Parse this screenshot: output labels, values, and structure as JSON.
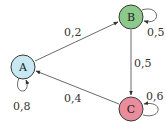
{
  "diagram": {
    "type": "markov-chain",
    "nodes": [
      {
        "id": "A",
        "label": "A",
        "color": "#c8e8f4"
      },
      {
        "id": "B",
        "label": "B",
        "color": "#8cc98a"
      },
      {
        "id": "C",
        "label": "C",
        "color": "#e98c9c"
      }
    ],
    "edges": [
      {
        "from": "A",
        "to": "B",
        "label": "0,2"
      },
      {
        "from": "B",
        "to": "C",
        "label": "0,5"
      },
      {
        "from": "C",
        "to": "A",
        "label": "0,4"
      },
      {
        "from": "A",
        "to": "A",
        "label": "0,8"
      },
      {
        "from": "B",
        "to": "B",
        "label": "0,5"
      },
      {
        "from": "C",
        "to": "C",
        "label": "0,6"
      }
    ]
  }
}
